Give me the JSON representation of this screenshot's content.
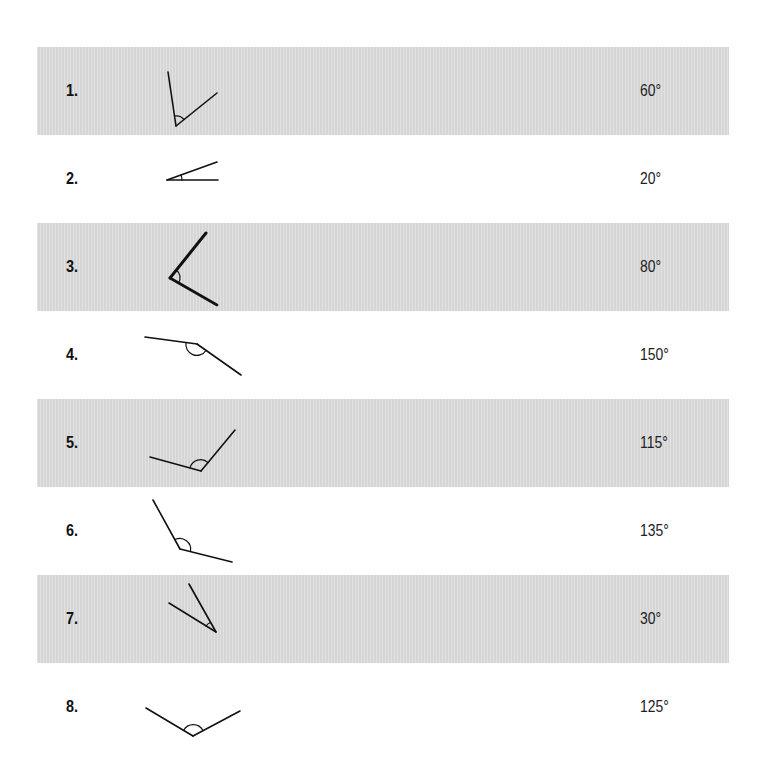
{
  "worksheet": {
    "rows": [
      {
        "number": "1.",
        "angle_value": "60°",
        "shaded": true
      },
      {
        "number": "2.",
        "angle_value": "20°",
        "shaded": false
      },
      {
        "number": "3.",
        "angle_value": "80°",
        "shaded": true
      },
      {
        "number": "4.",
        "angle_value": "150°",
        "shaded": false
      },
      {
        "number": "5.",
        "angle_value": "115°",
        "shaded": true
      },
      {
        "number": "6.",
        "angle_value": "135°",
        "shaded": false
      },
      {
        "number": "7.",
        "angle_value": "30°",
        "shaded": true
      },
      {
        "number": "8.",
        "angle_value": "125°",
        "shaded": false
      }
    ],
    "colors": {
      "band": "#dcdcdc",
      "ink": "#111111",
      "background": "#ffffff"
    }
  }
}
